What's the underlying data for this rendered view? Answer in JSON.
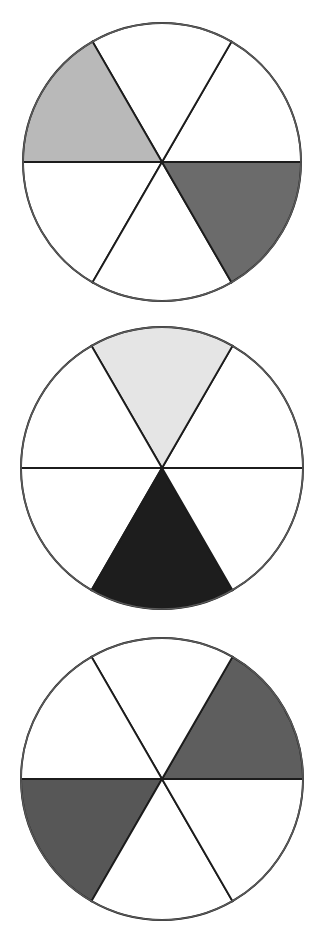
{
  "figure": {
    "type": "fraction-circles-diagram",
    "background_color": "#ffffff",
    "outline_color": "#5a5a5a",
    "divider_color": "#1c1c1c",
    "unshaded_color": "#ffffff",
    "sectors_per_circle": 6,
    "sector_angle_degrees": 60,
    "canvas": {
      "width": 322,
      "height": 950
    }
  },
  "chart_data": {
    "type": "pie",
    "title": "",
    "xlabel": "",
    "ylabel": "",
    "legend_position": "none",
    "grid": false,
    "categories": [
      "sector-1",
      "sector-2",
      "sector-3",
      "sector-4",
      "sector-5",
      "sector-6"
    ],
    "values": [
      60,
      60,
      60,
      60,
      60,
      60
    ],
    "charts": [
      {
        "name": "circle-1",
        "center": {
          "x": 162,
          "y": 162
        },
        "radius": 139,
        "slices": 6,
        "shaded_count": 2,
        "fraction_label": "2/6",
        "sectors": [
          {
            "index": 0,
            "start_deg": 0,
            "end_deg": 60,
            "position": "upper-right",
            "shaded": false,
            "color": "#ffffff"
          },
          {
            "index": 1,
            "start_deg": 60,
            "end_deg": 120,
            "position": "top",
            "shaded": false,
            "color": "#ffffff"
          },
          {
            "index": 2,
            "start_deg": 120,
            "end_deg": 180,
            "position": "upper-left",
            "shaded": true,
            "color": "#b9b9b9"
          },
          {
            "index": 3,
            "start_deg": 180,
            "end_deg": 240,
            "position": "lower-left",
            "shaded": false,
            "color": "#ffffff"
          },
          {
            "index": 4,
            "start_deg": 240,
            "end_deg": 300,
            "position": "bottom",
            "shaded": false,
            "color": "#ffffff"
          },
          {
            "index": 5,
            "start_deg": 300,
            "end_deg": 360,
            "position": "lower-right",
            "shaded": true,
            "color": "#6b6b6b"
          }
        ]
      },
      {
        "name": "circle-2",
        "center": {
          "x": 162,
          "y": 468
        },
        "radius": 141,
        "slices": 6,
        "shaded_count": 2,
        "fraction_label": "2/6",
        "sectors": [
          {
            "index": 0,
            "start_deg": 0,
            "end_deg": 60,
            "position": "upper-right",
            "shaded": false,
            "color": "#ffffff"
          },
          {
            "index": 1,
            "start_deg": 60,
            "end_deg": 120,
            "position": "top",
            "shaded": true,
            "color": "#e5e5e5"
          },
          {
            "index": 2,
            "start_deg": 120,
            "end_deg": 180,
            "position": "upper-left",
            "shaded": false,
            "color": "#ffffff"
          },
          {
            "index": 3,
            "start_deg": 180,
            "end_deg": 240,
            "position": "lower-left",
            "shaded": false,
            "color": "#ffffff"
          },
          {
            "index": 4,
            "start_deg": 240,
            "end_deg": 300,
            "position": "bottom",
            "shaded": true,
            "color": "#1d1d1d"
          },
          {
            "index": 5,
            "start_deg": 300,
            "end_deg": 360,
            "position": "lower-right",
            "shaded": false,
            "color": "#ffffff"
          }
        ]
      },
      {
        "name": "circle-3",
        "center": {
          "x": 162,
          "y": 779
        },
        "radius": 141,
        "slices": 6,
        "shaded_count": 2,
        "fraction_label": "2/6",
        "sectors": [
          {
            "index": 0,
            "start_deg": 0,
            "end_deg": 60,
            "position": "upper-right",
            "shaded": true,
            "color": "#5e5e5e"
          },
          {
            "index": 1,
            "start_deg": 60,
            "end_deg": 120,
            "position": "top",
            "shaded": false,
            "color": "#ffffff"
          },
          {
            "index": 2,
            "start_deg": 120,
            "end_deg": 180,
            "position": "upper-left",
            "shaded": false,
            "color": "#ffffff"
          },
          {
            "index": 3,
            "start_deg": 180,
            "end_deg": 240,
            "position": "lower-left",
            "shaded": true,
            "color": "#575757"
          },
          {
            "index": 4,
            "start_deg": 240,
            "end_deg": 300,
            "position": "bottom",
            "shaded": false,
            "color": "#ffffff"
          },
          {
            "index": 5,
            "start_deg": 300,
            "end_deg": 360,
            "position": "lower-right",
            "shaded": false,
            "color": "#ffffff"
          }
        ]
      }
    ]
  }
}
